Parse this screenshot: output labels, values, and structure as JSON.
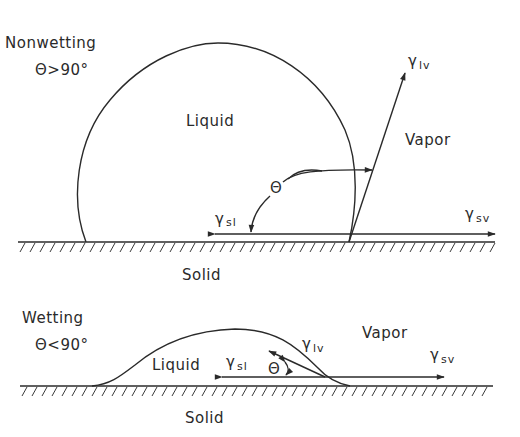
{
  "nonwetting": {
    "title": "Nonwetting",
    "condition": "Θ>90°",
    "liquid_label": "Liquid",
    "vapor_label": "Vapor",
    "solid_label": "Solid",
    "theta_label": "Θ",
    "gamma_lv": {
      "symbol": "γ",
      "sub": "lv"
    },
    "gamma_sl": {
      "symbol": "γ",
      "sub": "sl"
    },
    "gamma_sv": {
      "symbol": "γ",
      "sub": "sv"
    }
  },
  "wetting": {
    "title": "Wetting",
    "condition": "Θ<90°",
    "liquid_label": "Liquid",
    "vapor_label": "Vapor",
    "solid_label": "Solid",
    "theta_label": "Θ",
    "gamma_lv": {
      "symbol": "γ",
      "sub": "lv"
    },
    "gamma_sl": {
      "symbol": "γ",
      "sub": "sl"
    },
    "gamma_sv": {
      "symbol": "γ",
      "sub": "sv"
    }
  },
  "colors": {
    "ink": "#2a2a2a",
    "background": "#ffffff"
  }
}
